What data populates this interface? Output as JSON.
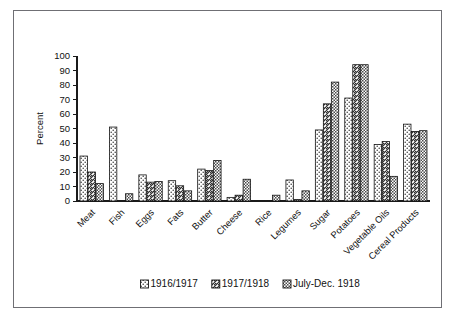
{
  "chart_data": {
    "type": "bar",
    "title": "",
    "xlabel": "",
    "ylabel": "Percent",
    "ylim": [
      0,
      100
    ],
    "ytick_step": 10,
    "yticks": [
      0,
      10,
      20,
      30,
      40,
      50,
      60,
      70,
      80,
      90,
      100
    ],
    "grid": false,
    "legend_position": "bottom",
    "categories": [
      "Meat",
      "Fish",
      "Eggs",
      "Fats",
      "Butter",
      "Cheese",
      "Rice",
      "Legumes",
      "Sugar",
      "Potatoes",
      "Vegetable Oils",
      "Cereal Products"
    ],
    "series": [
      {
        "name": "1916/1917",
        "pattern": "dotted",
        "values": [
          31,
          51,
          18,
          14,
          22,
          2.5,
          0,
          14.5,
          49,
          71,
          39,
          53
        ]
      },
      {
        "name": "1917/1918",
        "pattern": "diagonal-hatch",
        "values": [
          20,
          0,
          13,
          10.5,
          21,
          4,
          0,
          1,
          67,
          94,
          41,
          48
        ]
      },
      {
        "name": "July-Dec. 1918",
        "pattern": "dense-crosshatch",
        "values": [
          12,
          5,
          13.5,
          7,
          28,
          15,
          4,
          7,
          82,
          94,
          17,
          48.5
        ]
      }
    ]
  },
  "legend": {
    "entries": [
      {
        "label": "1916/1917",
        "swatch": "dotted"
      },
      {
        "label": "1917/1918",
        "swatch": "diagonal-hatch"
      },
      {
        "label": "July-Dec. 1918",
        "swatch": "dense-crosshatch"
      }
    ]
  },
  "colors": {
    "background": "#ffffff",
    "frame_border": "#6f6f74",
    "axis": "#1a1a1a",
    "bar_outline": "#151515",
    "text": "#111111"
  }
}
